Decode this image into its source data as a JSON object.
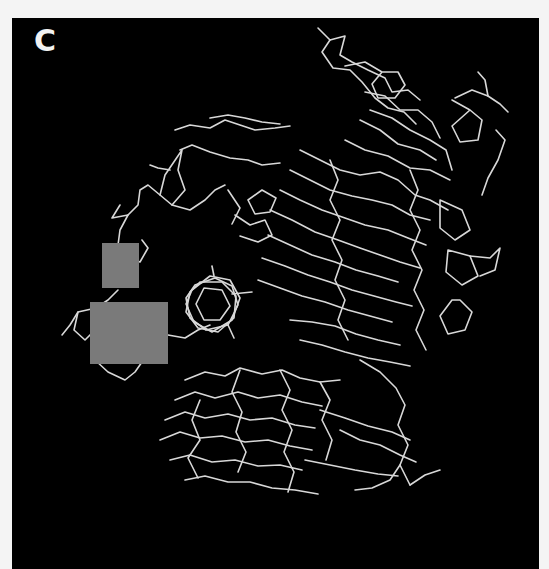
{
  "figure": {
    "panel_label": "C",
    "panel": {
      "x": 12,
      "y": 18,
      "width": 527,
      "height": 551,
      "background": "#000000"
    },
    "bond_color": "#d8d8d8",
    "redaction_color": "#7a7a7a",
    "redactions": [
      {
        "x": 102,
        "y": 243,
        "width": 37,
        "height": 45
      },
      {
        "x": 90,
        "y": 302,
        "width": 78,
        "height": 62
      }
    ]
  }
}
